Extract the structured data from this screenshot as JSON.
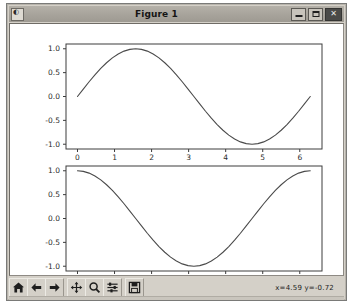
{
  "window": {
    "title": "Figure 1",
    "icon": "matplotlib-icon",
    "buttons": {
      "minimize": "–",
      "maximize": "□",
      "close": "✕"
    }
  },
  "toolbar": {
    "items": [
      {
        "name": "home-button",
        "label": "Home",
        "icon": "home-icon"
      },
      {
        "name": "back-button",
        "label": "Back",
        "icon": "arrow-left-icon"
      },
      {
        "name": "forward-button",
        "label": "Forward",
        "icon": "arrow-right-icon"
      },
      {
        "name": "pan-button",
        "label": "Pan",
        "icon": "move-icon"
      },
      {
        "name": "zoom-button",
        "label": "Zoom",
        "icon": "magnifier-icon"
      },
      {
        "name": "configure-subplots-button",
        "label": "Subplots",
        "icon": "sliders-icon"
      },
      {
        "name": "save-button",
        "label": "Save",
        "icon": "floppy-disk-icon"
      }
    ],
    "coordinates": "x=4.59  y=-0.72"
  },
  "chart_data": [
    {
      "type": "line",
      "name": "sine-subplot",
      "title": "",
      "xlabel": "",
      "ylabel": "",
      "xlim": [
        -0.31,
        6.6
      ],
      "ylim": [
        -1.1,
        1.1
      ],
      "xticks": [
        0,
        1,
        2,
        3,
        4,
        5,
        6
      ],
      "xticklabels": [
        "0",
        "1",
        "2",
        "3",
        "4",
        "5",
        "6"
      ],
      "yticks": [
        -1.0,
        -0.5,
        0.0,
        0.5,
        1.0
      ],
      "yticklabels": [
        "-1.0",
        "-0.5",
        "0.0",
        "0.5",
        "1.0"
      ],
      "grid": false,
      "legend": null,
      "line_color": "#4a4a4a",
      "series": [
        {
          "name": "sin(x)",
          "x": [
            0.0,
            0.157,
            0.314,
            0.471,
            0.628,
            0.785,
            0.942,
            1.1,
            1.257,
            1.414,
            1.571,
            1.728,
            1.885,
            2.042,
            2.199,
            2.356,
            2.513,
            2.67,
            2.827,
            2.985,
            3.142,
            3.299,
            3.456,
            3.613,
            3.77,
            3.927,
            4.084,
            4.241,
            4.398,
            4.555,
            4.712,
            4.869,
            5.027,
            5.184,
            5.341,
            5.498,
            5.655,
            5.812,
            5.969,
            6.126,
            6.283
          ],
          "y": [
            0.0,
            0.156,
            0.309,
            0.454,
            0.588,
            0.707,
            0.809,
            0.891,
            0.951,
            0.988,
            1.0,
            0.988,
            0.951,
            0.891,
            0.809,
            0.707,
            0.588,
            0.454,
            0.309,
            0.156,
            0.0,
            -0.156,
            -0.309,
            -0.454,
            -0.588,
            -0.707,
            -0.809,
            -0.891,
            -0.951,
            -0.988,
            -1.0,
            -0.988,
            -0.951,
            -0.891,
            -0.809,
            -0.707,
            -0.588,
            -0.454,
            -0.309,
            -0.156,
            0.0
          ]
        }
      ]
    },
    {
      "type": "line",
      "name": "cosine-subplot",
      "title": "",
      "xlabel": "",
      "ylabel": "",
      "xlim": [
        -0.31,
        6.6
      ],
      "ylim": [
        -1.1,
        1.1
      ],
      "xticks": [
        0,
        1,
        2,
        3,
        4,
        5,
        6
      ],
      "xticklabels": [
        "0",
        "1",
        "2",
        "3",
        "4",
        "5",
        "6"
      ],
      "yticks": [
        -1.0,
        -0.5,
        0.0,
        0.5,
        1.0
      ],
      "yticklabels": [
        "-1.0",
        "-0.5",
        "0.0",
        "0.5",
        "1.0"
      ],
      "grid": false,
      "legend": null,
      "line_color": "#4a4a4a",
      "series": [
        {
          "name": "cos(x)",
          "x": [
            0.0,
            0.157,
            0.314,
            0.471,
            0.628,
            0.785,
            0.942,
            1.1,
            1.257,
            1.414,
            1.571,
            1.728,
            1.885,
            2.042,
            2.199,
            2.356,
            2.513,
            2.67,
            2.827,
            2.985,
            3.142,
            3.299,
            3.456,
            3.613,
            3.77,
            3.927,
            4.084,
            4.241,
            4.398,
            4.555,
            4.712,
            4.869,
            5.027,
            5.184,
            5.341,
            5.498,
            5.655,
            5.812,
            5.969,
            6.126,
            6.283
          ],
          "y": [
            1.0,
            0.988,
            0.951,
            0.891,
            0.809,
            0.707,
            0.588,
            0.454,
            0.309,
            0.156,
            0.0,
            -0.156,
            -0.309,
            -0.454,
            -0.588,
            -0.707,
            -0.809,
            -0.891,
            -0.951,
            -0.988,
            -1.0,
            -0.988,
            -0.951,
            -0.891,
            -0.809,
            -0.707,
            -0.588,
            -0.454,
            -0.309,
            -0.156,
            0.0,
            0.156,
            0.309,
            0.454,
            0.588,
            0.707,
            0.809,
            0.891,
            0.951,
            0.988,
            1.0
          ]
        }
      ]
    }
  ],
  "colors": {
    "window_face": "#d4d0c8",
    "titlebar": "#a8a49c",
    "canvas": "#ffffff",
    "axis_line": "#3c3c3c",
    "tick_label": "#2b2b2b",
    "line": "#4a4a4a"
  }
}
